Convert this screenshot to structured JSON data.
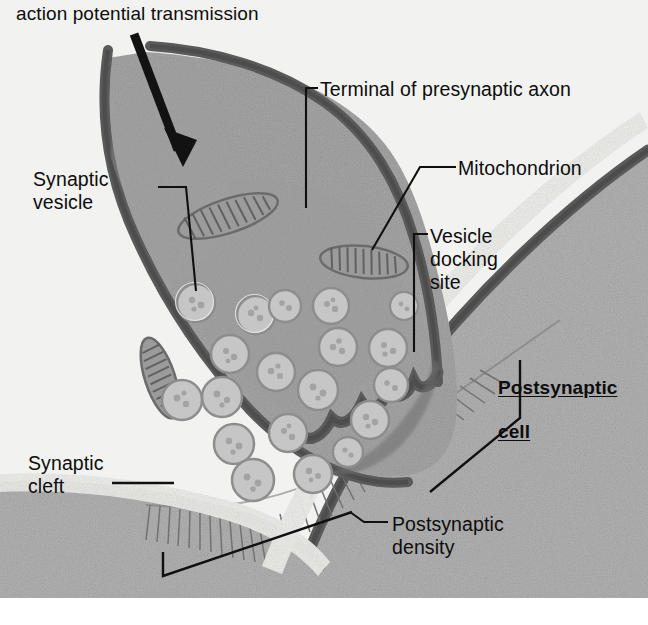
{
  "figure": {
    "kind": "electron-micrograph-style illustration of a chemical synapse",
    "background_color": "#f2f2f0",
    "labels": {
      "action_potential": "action potential transmission",
      "terminal": "Terminal of presynaptic axon",
      "mitochondrion": "Mitochondrion",
      "vesicle_docking_site": "Vesicle\ndocking\nsite",
      "synaptic_vesicle": "Synaptic\nvesicle",
      "postsynaptic_cell_line1": "Postsynaptic",
      "postsynaptic_cell_line2": "cell",
      "synaptic_cleft": "Synaptic\ncleft",
      "postsynaptic_density": "Postsynaptic\ndensity"
    },
    "colors": {
      "membrane": "#5d5d5d",
      "presynaptic_cytoplasm": "#a6a6a6",
      "postsynaptic_cytoplasm": "#b2b2b2",
      "cleft": "#ededea",
      "vesicle_fill": "#c9c9c9",
      "leader_line": "#111111",
      "text": "#0d0d0d",
      "arrow": "#121212"
    },
    "counts": {
      "synaptic_vesicles": 19,
      "mitochondria": 3,
      "docking_indentations": 5
    }
  }
}
